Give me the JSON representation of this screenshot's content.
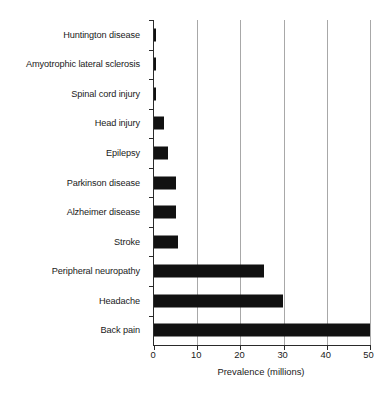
{
  "chart_data": {
    "type": "bar",
    "orientation": "horizontal",
    "title": "",
    "xlabel": "Prevalence (millions)",
    "ylabel": "",
    "xlim": [
      0,
      50
    ],
    "xticks": [
      0,
      10,
      20,
      30,
      40,
      50
    ],
    "grid": "vertical-major",
    "legend": "none",
    "bar_color": "#111111",
    "grid_color": "#a8a8a8",
    "axis_color": "#2a2a2a",
    "background": "#ffffff",
    "categories": [
      "Huntington disease",
      "Amyotrophic lateral sclerosis",
      "Spinal cord injury",
      "Head injury",
      "Epilepsy",
      "Parkinson disease",
      "Alzheimer disease",
      "Stroke",
      "Peripheral neuropathy",
      "Headache",
      "Back pain"
    ],
    "values": [
      0.5,
      0.5,
      0.5,
      2.3,
      3.2,
      5.0,
      5.0,
      5.5,
      25.5,
      30.0,
      50.0
    ]
  }
}
